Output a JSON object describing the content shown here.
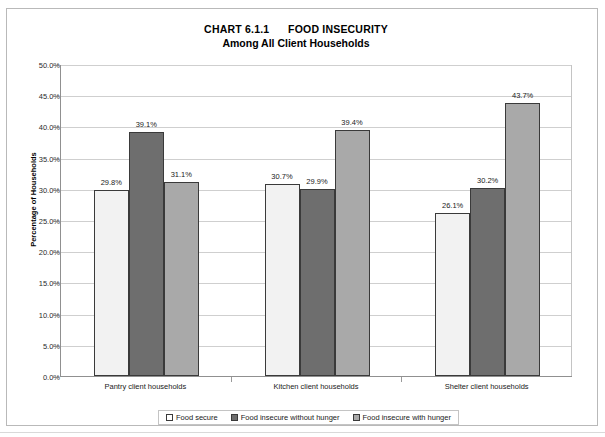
{
  "chart_data": {
    "type": "bar",
    "title": "CHART 6.1.1      FOOD INSECURITY",
    "subtitle": "Among All Client Households",
    "xlabel": "",
    "ylabel": "Percentage of Households",
    "ylim": [
      0,
      50
    ],
    "ytick_step": 5,
    "ytick_labels": [
      "0.0%",
      "5.0%",
      "10.0%",
      "15.0%",
      "20.0%",
      "25.0%",
      "30.0%",
      "35.0%",
      "40.0%",
      "45.0%",
      "50.0%"
    ],
    "ytick_values": [
      0,
      5,
      10,
      15,
      20,
      25,
      30,
      35,
      40,
      45,
      50
    ],
    "grid": true,
    "legend_position": "bottom",
    "categories": [
      "Pantry client households",
      "Kitchen client households",
      "Shelter client households"
    ],
    "series": [
      {
        "name": "Food secure",
        "color": "#f2f2f2",
        "values": [
          29.8,
          30.7,
          26.1
        ],
        "labels": [
          "29.8%",
          "30.7%",
          "26.1%"
        ]
      },
      {
        "name": "Food insecure without hunger",
        "color": "#6e6e6e",
        "values": [
          39.1,
          29.9,
          30.2
        ],
        "labels": [
          "39.1%",
          "29.9%",
          "30.2%"
        ]
      },
      {
        "name": "Food insecure with hunger",
        "color": "#a9a9a9",
        "values": [
          31.1,
          39.4,
          43.7
        ],
        "labels": [
          "31.1%",
          "39.4%",
          "43.7%"
        ]
      }
    ]
  }
}
